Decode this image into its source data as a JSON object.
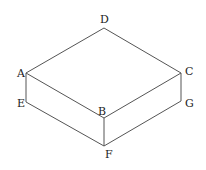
{
  "diagram": {
    "type": "isometric-box",
    "vertices": {
      "A": {
        "label": "A",
        "x": 26,
        "y": 73,
        "lx": 17,
        "ly": 77
      },
      "B": {
        "label": "B",
        "x": 104,
        "y": 118,
        "lx": 98,
        "ly": 115
      },
      "C": {
        "label": "C",
        "x": 181,
        "y": 73,
        "lx": 185,
        "ly": 75
      },
      "D": {
        "label": "D",
        "x": 104,
        "y": 28,
        "lx": 100,
        "ly": 23
      },
      "E": {
        "label": "E",
        "x": 26,
        "y": 102,
        "lx": 17,
        "ly": 107
      },
      "F": {
        "label": "F",
        "x": 104,
        "y": 146,
        "lx": 105,
        "ly": 158
      },
      "G": {
        "label": "G",
        "x": 181,
        "y": 101,
        "lx": 185,
        "ly": 107
      }
    },
    "edges": [
      [
        "A",
        "D"
      ],
      [
        "D",
        "C"
      ],
      [
        "C",
        "B"
      ],
      [
        "B",
        "A"
      ],
      [
        "A",
        "E"
      ],
      [
        "E",
        "F"
      ],
      [
        "F",
        "G"
      ],
      [
        "G",
        "C"
      ],
      [
        "B",
        "F"
      ]
    ],
    "stroke_color": "#555555",
    "label_color": "#222222"
  }
}
